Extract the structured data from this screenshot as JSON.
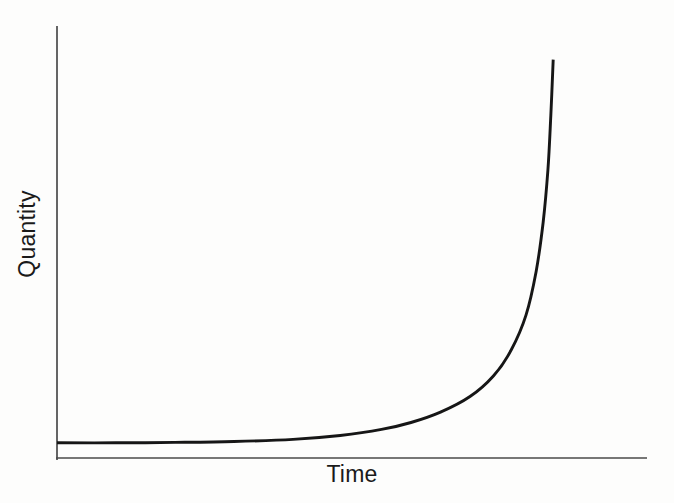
{
  "chart_data": {
    "type": "line",
    "title": "",
    "xlabel": "Time",
    "ylabel": "Quantity",
    "x_range": [
      0,
      1
    ],
    "y_range": [
      0,
      1
    ],
    "grid": false,
    "legend": null,
    "ticks": "none (axes are unlabeled qualitative axes)",
    "series": [
      {
        "name": "quantity-vs-time-growth-curve",
        "shape": "J-shaped hyperbolic growth: nearly flat just above zero for most of the time range, then rising ever more steeply until almost vertical at t ≈ 0.84",
        "points": [
          [
            0.0,
            0.035
          ],
          [
            0.1,
            0.035
          ],
          [
            0.2,
            0.036
          ],
          [
            0.3,
            0.038
          ],
          [
            0.4,
            0.043
          ],
          [
            0.48,
            0.052
          ],
          [
            0.55,
            0.066
          ],
          [
            0.6,
            0.082
          ],
          [
            0.65,
            0.106
          ],
          [
            0.7,
            0.142
          ],
          [
            0.74,
            0.19
          ],
          [
            0.77,
            0.25
          ],
          [
            0.795,
            0.33
          ],
          [
            0.812,
            0.43
          ],
          [
            0.824,
            0.545
          ],
          [
            0.832,
            0.665
          ],
          [
            0.837,
            0.79
          ],
          [
            0.841,
            0.92
          ]
        ]
      }
    ]
  },
  "colors": {
    "background": "#fdfdfc",
    "axis": "#4a4a4a",
    "curve": "#161616",
    "text": "#1a1a1a"
  }
}
